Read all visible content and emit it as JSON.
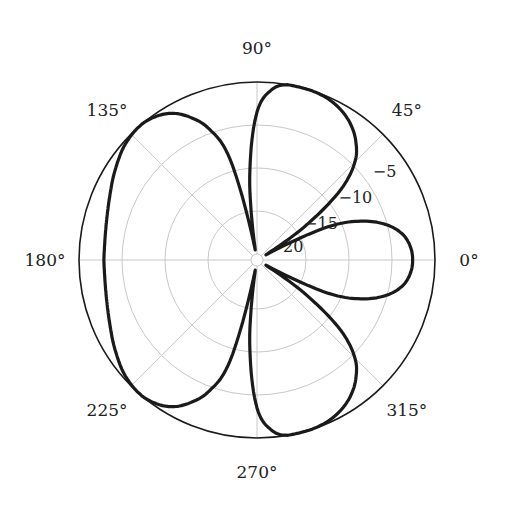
{
  "chart_data": {
    "type": "polar-line",
    "title": "",
    "angular_unit": "degrees",
    "radial_unit": "dB",
    "angle_ticks": [
      0,
      45,
      90,
      135,
      180,
      225,
      270,
      315
    ],
    "angle_tick_labels": [
      "0°",
      "45°",
      "90°",
      "135°",
      "180°",
      "225°",
      "270°",
      "315°"
    ],
    "radial_ticks": [
      -5,
      -10,
      -15,
      -20
    ],
    "radial_tick_labels": [
      "−5",
      "−10",
      "−15",
      "20"
    ],
    "radial_range": [
      -20,
      0
    ],
    "grid": true,
    "legend": null,
    "series": [
      {
        "name": "pattern",
        "color": "#1a1a1a",
        "theta": [
          0,
          5,
          10,
          15,
          20,
          25,
          30,
          35,
          40,
          45,
          50,
          55,
          60,
          65,
          70,
          75,
          80,
          85,
          90,
          95,
          100,
          105,
          110,
          115,
          120,
          125,
          130,
          135,
          140,
          145,
          150,
          155,
          160,
          165,
          170,
          175,
          180,
          185,
          190,
          195,
          200,
          205,
          210,
          215,
          220,
          225,
          230,
          235,
          240,
          245,
          250,
          255,
          260,
          265,
          270,
          275,
          280,
          285,
          290,
          295,
          300,
          305,
          310,
          315,
          320,
          325,
          330,
          335,
          340,
          345,
          350,
          355,
          360
        ],
        "r_db": [
          -2.6,
          -2.8,
          -3.5,
          -5.0,
          -7.5,
          -11.5,
          -19.5,
          -14.0,
          -8.0,
          -4.6,
          -2.8,
          -1.6,
          -0.8,
          -0.3,
          -0.05,
          0.0,
          0.0,
          -0.8,
          -3.5,
          -11.0,
          -19.5,
          -8.5,
          -4.5,
          -2.4,
          -1.0,
          -0.3,
          0.0,
          -0.1,
          -0.4,
          -0.9,
          -1.4,
          -1.9,
          -2.3,
          -2.6,
          -2.8,
          -2.9,
          -2.9,
          -2.9,
          -2.8,
          -2.6,
          -2.3,
          -1.9,
          -1.4,
          -0.9,
          -0.4,
          -0.1,
          0.0,
          -0.3,
          -1.0,
          -2.4,
          -4.5,
          -8.5,
          -19.5,
          -11.0,
          -3.5,
          -0.8,
          0.0,
          0.0,
          -0.05,
          -0.3,
          -0.8,
          -1.6,
          -2.8,
          -4.6,
          -8.0,
          -14.0,
          -19.5,
          -11.5,
          -7.5,
          -5.0,
          -3.5,
          -2.8,
          -2.6
        ]
      }
    ]
  },
  "layout": {
    "center": [
      257,
      260
    ],
    "outer_radius": 178,
    "inner_radius": 6
  },
  "colors": {
    "curve": "#1a1a1a",
    "outer_circle": "#1a1a1a",
    "grid": "#c8c8c8",
    "text": "#222222"
  }
}
